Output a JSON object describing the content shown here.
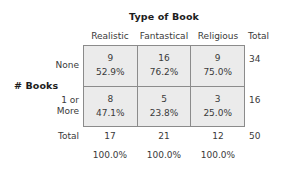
{
  "chart_data": {
    "type": "table",
    "title": "Type of Book",
    "row_variable": "# Books",
    "column_variable": "Type of Book",
    "categories": [
      "Realistic",
      "Fantastical",
      "Religious"
    ],
    "row_categories": [
      "None",
      "1 or More"
    ],
    "total_label": "Total",
    "cells": [
      [
        {
          "count": "9",
          "percent": "52.9%"
        },
        {
          "count": "16",
          "percent": "76.2%"
        },
        {
          "count": "9",
          "percent": "75.0%"
        }
      ],
      [
        {
          "count": "8",
          "percent": "47.1%"
        },
        {
          "count": "5",
          "percent": "23.8%"
        },
        {
          "count": "3",
          "percent": "25.0%"
        }
      ]
    ],
    "row_totals": [
      "34",
      "16"
    ],
    "column_totals": [
      "17",
      "21",
      "12"
    ],
    "column_total_percents": [
      "100.0%",
      "100.0%",
      "100.0%"
    ],
    "grand_total": "50",
    "note": "Column percentages; counts on top, percent of column below"
  },
  "title": "Type of Book",
  "stub_title": "# Books",
  "headers": {
    "columns": [
      "Realistic",
      "Fantastical",
      "Religious"
    ],
    "total": "Total"
  },
  "rows": [
    {
      "label": "None",
      "cells": [
        {
          "count": "9",
          "percent": "52.9%"
        },
        {
          "count": "16",
          "percent": "76.2%"
        },
        {
          "count": "9",
          "percent": "75.0%"
        }
      ],
      "total": "34"
    },
    {
      "label_line1": "1 or",
      "label_line2": "More",
      "cells": [
        {
          "count": "8",
          "percent": "47.1%"
        },
        {
          "count": "5",
          "percent": "23.8%"
        },
        {
          "count": "3",
          "percent": "25.0%"
        }
      ],
      "total": "16"
    }
  ],
  "totals_row": {
    "label": "Total",
    "values": [
      "17",
      "21",
      "12"
    ],
    "grand_total": "50"
  },
  "percent_row": {
    "values": [
      "100.0%",
      "100.0%",
      "100.0%"
    ]
  },
  "colors": {
    "cell_fill": "#ebebeb",
    "border": "#8b8b8b",
    "text": "#3a3a3a",
    "background": "#ffffff"
  }
}
